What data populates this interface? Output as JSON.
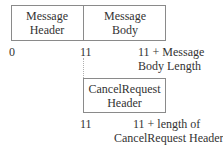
{
  "top_row": {
    "cells": [
      {
        "line1": "Message",
        "line2": "Header"
      },
      {
        "line1": "Message",
        "line2": "Body"
      }
    ],
    "offsets": {
      "start": "0",
      "middle": "11",
      "end_line1": "11 + Message",
      "end_line2": "Body Length"
    }
  },
  "bottom_row": {
    "cell": {
      "line1": "CancelRequest",
      "line2": "Header"
    },
    "offsets": {
      "start": "11",
      "end_line1": "11 + length of",
      "end_line2": "CancelRequest Header"
    }
  }
}
